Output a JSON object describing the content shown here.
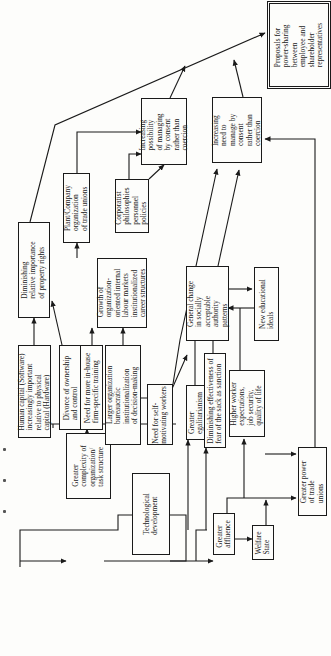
{
  "diagram": {
    "orientation": "rotated-90-ccw",
    "nodes": [
      {
        "id": "tech",
        "label": "Technological\ndevelopment"
      },
      {
        "id": "complexity",
        "label": "Greater\ncomplexity of\norganization/\ntask structure"
      },
      {
        "id": "human_capital",
        "label": "Human capital (Software)\nincreasingly important\nrelative to physical\ncapital (Hardware)"
      },
      {
        "id": "divorce",
        "label": "Divorce of ownership\nand control"
      },
      {
        "id": "inhouse",
        "label": "Need for more in-house\nfirm-specific training"
      },
      {
        "id": "larger_org",
        "label": "Larger organization\nbureaucratic\ninstitutionalization\nof decision-making"
      },
      {
        "id": "self_motivating",
        "label": "Need for self-\nmotivating workers"
      },
      {
        "id": "property",
        "label": "Diminishing\nrelative importance\nof property rights"
      },
      {
        "id": "internal_markets",
        "label": "Growth of\norganization-\noriented internal\nlabour markets\ninstitutionalized\ncareer structures"
      },
      {
        "id": "plant_company",
        "label": "Plant/Company\norganization\nof trade unions"
      },
      {
        "id": "corporatist",
        "label": "Corporatist\nphilosophies\npersonnel\npolicies"
      },
      {
        "id": "possibility",
        "label": "Increasing\npossibility\nof managing\nby consent\nrather than\ncoercion"
      },
      {
        "id": "proposals",
        "label": "Proposals for\npower-sharing\nbetween\nemployee and\nshareholder\nrepresentatives"
      },
      {
        "id": "need_consent",
        "label": "Increasing\nneed to\nmanage by\nconsent\nrather than\ncoercion"
      },
      {
        "id": "authority",
        "label": "General change\nin socially\nacceptable\nauthority\npatterns"
      },
      {
        "id": "education",
        "label": "New educational\nideals"
      },
      {
        "id": "egalitarianism",
        "label": "Greater\negalitarianism"
      },
      {
        "id": "sack",
        "label": "Diminishing effectiveness of\nfear of the sack as sanction"
      },
      {
        "id": "expectations",
        "label": "Higher worker\nexpectations,\njob security,\nquality of life"
      },
      {
        "id": "affluence",
        "label": "Greater\naffluence"
      },
      {
        "id": "welfare",
        "label": "Welfare\nState"
      },
      {
        "id": "union_power",
        "label": "Greater power\nof trade\nunions"
      }
    ],
    "edges": [
      [
        "tech",
        "complexity"
      ],
      [
        "tech",
        "affluence"
      ],
      [
        "complexity",
        "human_capital"
      ],
      [
        "complexity",
        "divorce"
      ],
      [
        "complexity",
        "inhouse"
      ],
      [
        "complexity",
        "larger_org"
      ],
      [
        "complexity",
        "self_motivating"
      ],
      [
        "human_capital",
        "property"
      ],
      [
        "divorce",
        "property"
      ],
      [
        "inhouse",
        "internal_markets"
      ],
      [
        "larger_org",
        "internal_markets"
      ],
      [
        "internal_markets",
        "plant_company"
      ],
      [
        "property",
        "proposals"
      ],
      [
        "plant_company",
        "possibility"
      ],
      [
        "corporatist",
        "possibility"
      ],
      [
        "possibility",
        "proposals"
      ],
      [
        "need_consent",
        "proposals"
      ],
      [
        "larger_org",
        "authority"
      ],
      [
        "self_motivating",
        "need_consent"
      ],
      [
        "authority",
        "need_consent"
      ],
      [
        "authority",
        "education"
      ],
      [
        "education",
        "authority"
      ],
      [
        "egalitarianism",
        "authority"
      ],
      [
        "sack",
        "authority"
      ],
      [
        "affluence",
        "egalitarianism"
      ],
      [
        "affluence",
        "sack"
      ],
      [
        "affluence",
        "welfare"
      ],
      [
        "affluence",
        "expectations"
      ],
      [
        "affluence",
        "union_power"
      ],
      [
        "welfare",
        "expectations"
      ],
      [
        "expectations",
        "union_power"
      ],
      [
        "expectations",
        "education"
      ],
      [
        "union_power",
        "need_consent"
      ]
    ]
  }
}
